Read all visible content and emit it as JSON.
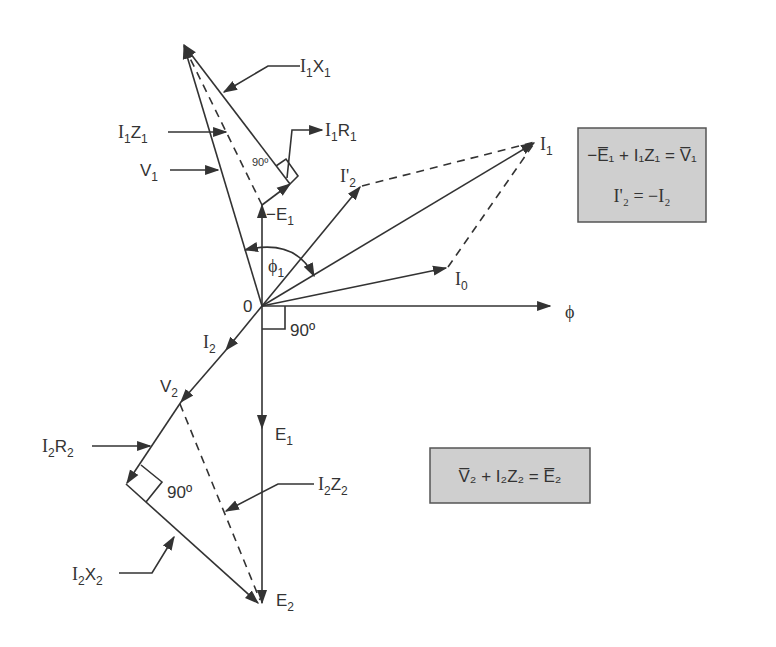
{
  "diagram": {
    "type": "phasor-diagram",
    "origin_label": "0",
    "flux_label": "ϕ",
    "phase_angle_label": {
      "base": "ϕ",
      "sub": "1"
    },
    "right_angle_labels": [
      "90º",
      "90º",
      "90º"
    ],
    "phasors": [
      {
        "id": "V1",
        "base": "V",
        "sub": "1"
      },
      {
        "id": "I1Z1",
        "base": "I",
        "sub": "1",
        "base2": "Z",
        "sub2": "1"
      },
      {
        "id": "I1X1",
        "base": "I",
        "sub": "1",
        "base2": "X",
        "sub2": "1"
      },
      {
        "id": "I1R1",
        "base": "I",
        "sub": "1",
        "base2": "R",
        "sub2": "1"
      },
      {
        "id": "minusE1",
        "base": "−E",
        "sub": "1"
      },
      {
        "id": "I2prime",
        "base": "I'",
        "sub": "2"
      },
      {
        "id": "I1",
        "base": "I",
        "sub": "1"
      },
      {
        "id": "I0",
        "base": "I",
        "sub": "0"
      },
      {
        "id": "I2",
        "base": "I",
        "sub": "2"
      },
      {
        "id": "V2",
        "base": "V",
        "sub": "2"
      },
      {
        "id": "E1",
        "base": "E",
        "sub": "1"
      },
      {
        "id": "I2R2",
        "base": "I",
        "sub": "2",
        "base2": "R",
        "sub2": "2"
      },
      {
        "id": "I2Z2",
        "base": "I",
        "sub": "2",
        "base2": "Z",
        "sub2": "2"
      },
      {
        "id": "I2X2",
        "base": "I",
        "sub": "2",
        "base2": "X",
        "sub2": "2"
      },
      {
        "id": "E2",
        "base": "E",
        "sub": "2"
      }
    ],
    "equations": {
      "primary": {
        "line1": "−E̅₁ + I₁Z₁ = V̅₁",
        "line2": "I'₂ = −I₂"
      },
      "secondary": {
        "line1": "V̅₂ + I₂Z₂ = E̅₂"
      }
    },
    "colors": {
      "line": "#333333",
      "box_fill": "#cfcfcf",
      "box_border": "#555555",
      "background": "#ffffff"
    }
  }
}
